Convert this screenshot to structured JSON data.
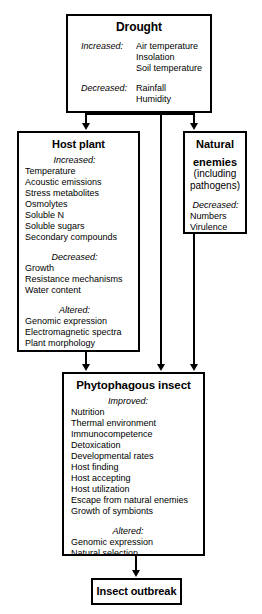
{
  "diagram": {
    "nodes": {
      "drought": {
        "title": "Drought",
        "groups": [
          {
            "label": "Increased:",
            "items": [
              "Air temperature",
              "Insolation",
              "Soil temperature"
            ]
          },
          {
            "label": "Decreased:",
            "items": [
              "Rainfall",
              "Humidity"
            ]
          }
        ]
      },
      "host_plant": {
        "title": "Host plant",
        "groups": [
          {
            "label": "Increased:",
            "items": [
              "Temperature",
              "Acoustic emissions",
              "Stress metabolites",
              "Osmolytes",
              "Soluble N",
              "Soluble sugars",
              "Secondary compounds"
            ]
          },
          {
            "label": "Decreased:",
            "items": [
              "Growth",
              "Resistance mechanisms",
              "Water content"
            ]
          },
          {
            "label": "Altered:",
            "items": [
              "Genomic expression",
              "Electromagnetic spectra",
              "Plant morphology"
            ]
          }
        ]
      },
      "natural_enemies": {
        "title_line1": "Natural",
        "title_line2": "enemies",
        "sub_line1": "(including",
        "sub_line2": "pathogens)",
        "groups": [
          {
            "label": "Decreased:",
            "items": [
              "Numbers",
              "Virulence"
            ]
          }
        ]
      },
      "phytophagous_insect": {
        "title": "Phytophagous insect",
        "groups": [
          {
            "label": "Improved:",
            "items": [
              "Nutrition",
              "Thermal environment",
              "Immunocompetence",
              "Detoxication",
              "Developmental rates",
              "Host finding",
              "Host accepting",
              "Host utilization",
              "Escape from natural enemies",
              "Growth of symbionts"
            ]
          },
          {
            "label": "Altered:",
            "items": [
              "Genomic expression",
              "Natural selection"
            ]
          }
        ]
      },
      "insect_outbreak": {
        "title": "Insect outbreak"
      }
    },
    "edges": [
      {
        "name": "drought-to-host-plant",
        "from": "drought",
        "to": "host_plant"
      },
      {
        "name": "drought-to-phytophagous-insect",
        "from": "drought",
        "to": "phytophagous_insect"
      },
      {
        "name": "drought-to-natural-enemies",
        "from": "drought",
        "to": "natural_enemies"
      },
      {
        "name": "host-plant-to-phytophagous-insect",
        "from": "host_plant",
        "to": "phytophagous_insect"
      },
      {
        "name": "natural-enemies-to-phytophagous-insect",
        "from": "natural_enemies",
        "to": "phytophagous_insect"
      },
      {
        "name": "phytophagous-insect-to-insect-outbreak",
        "from": "phytophagous_insect",
        "to": "insect_outbreak"
      }
    ],
    "colors": {
      "line": "#000000",
      "background": "#ffffff",
      "text": "#000000"
    }
  }
}
